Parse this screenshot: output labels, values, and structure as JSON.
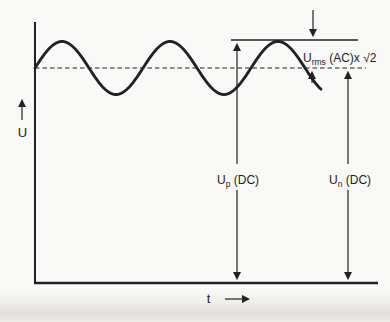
{
  "figure": {
    "kind": "ripple-voltage-waveform-diagram",
    "axes": {
      "y_label": "U",
      "x_label": "t"
    },
    "labels": {
      "ripple": {
        "base": "U",
        "sub": "rms",
        "rest": " (AC)x √2"
      },
      "peak_dc": {
        "base": "U",
        "sub": "p",
        "rest": " (DC)"
      },
      "nominal_dc": {
        "base": "U",
        "sub": "n",
        "rest": " (DC)"
      }
    },
    "wave": {
      "start_x": 35,
      "end_x": 322,
      "mean_y": 68,
      "amplitude": 26.5,
      "period": 108
    },
    "levels": {
      "dc_mean_dashed_y": 68,
      "peak_line_y": 40
    },
    "colors": {
      "ink": "#222222",
      "paper": "#f9f9f7",
      "shadow": "#e2e1dc"
    }
  }
}
